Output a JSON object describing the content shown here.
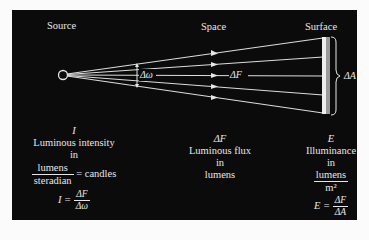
{
  "headers": {
    "source": "Source",
    "space": "Space",
    "surface": "Surface"
  },
  "diagram_labels": {
    "solid_angle": "Δω",
    "flux": "ΔF",
    "area": "ΔA"
  },
  "columns": {
    "source": {
      "symbol": "I",
      "quantity": "Luminous intensity",
      "in": "in",
      "unit_numerator": "lumens",
      "unit_denominator": "steradian",
      "equals_unit": "= candles",
      "formula_lhs": "I =",
      "formula_num": "ΔF",
      "formula_den": "Δω"
    },
    "space": {
      "symbol": "ΔF",
      "quantity": "Luminous flux",
      "in": "in",
      "unit": "lumens"
    },
    "surface": {
      "symbol": "E",
      "quantity": "Illuminance",
      "in": "in",
      "unit_numerator": "lumens",
      "unit_denominator": "m²",
      "formula_lhs": "E =",
      "formula_num": "ΔF",
      "formula_den": "ΔA"
    }
  },
  "colors": {
    "background": "#0b0b0b",
    "foreground": "#e6e6e6",
    "page": "#fbfbfb"
  }
}
